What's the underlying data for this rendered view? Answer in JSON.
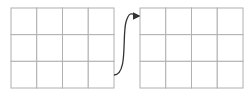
{
  "diagram": {
    "grid_color": "#b0b0b0",
    "arrow_color": "#333333",
    "left_grid": {
      "x": 11,
      "y": 8,
      "width": 103,
      "height": 80,
      "cols": 4,
      "rows": 3
    },
    "right_grid": {
      "x": 140,
      "y": 8,
      "width": 103,
      "height": 80,
      "cols": 4,
      "rows": 3
    },
    "arrow": {
      "from": [
        114,
        75
      ],
      "to": [
        140,
        16
      ]
    }
  }
}
